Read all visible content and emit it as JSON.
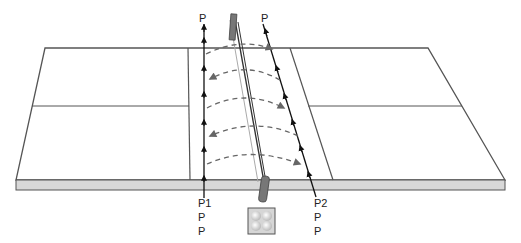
{
  "diagram": {
    "type": "court-drill",
    "colors": {
      "line": "#555555",
      "arrow": "#111111",
      "dashed_arrow": "#666666",
      "base_band": "#d8d8d8",
      "post": "#777777"
    },
    "players": {
      "top_left": "P",
      "top_right": "P",
      "bottom_left": [
        "P1",
        "P",
        "P"
      ],
      "bottom_right": [
        "P2",
        "P",
        "P"
      ]
    },
    "ball_basket": {
      "label": "",
      "ball_count": 4
    },
    "exchanges": [
      {
        "direction": "left-to-right"
      },
      {
        "direction": "right-to-left"
      },
      {
        "direction": "left-to-right"
      },
      {
        "direction": "right-to-left"
      },
      {
        "direction": "left-to-right"
      }
    ]
  }
}
